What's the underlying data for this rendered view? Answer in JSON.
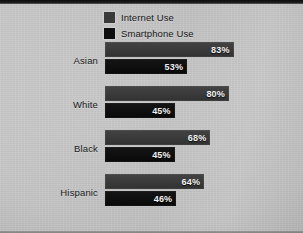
{
  "chart_data": {
    "type": "bar",
    "orientation": "horizontal",
    "title": "",
    "xlabel": "",
    "ylabel": "",
    "xlim": [
      0,
      100
    ],
    "grid": false,
    "legend_position": "top-left",
    "categories": [
      "Asian",
      "White",
      "Black",
      "Hispanic"
    ],
    "series": [
      {
        "name": "Internet Use",
        "color": "#3a3a3a",
        "values": [
          83,
          80,
          68,
          64
        ],
        "labels": [
          "83%",
          "80%",
          "68%",
          "64%"
        ]
      },
      {
        "name": "Smartphone Use",
        "color": "#0e0e0e",
        "values": [
          53,
          45,
          45,
          46
        ],
        "labels": [
          "53%",
          "45%",
          "45%",
          "46%"
        ]
      }
    ]
  },
  "legend": {
    "items": [
      {
        "label": "Internet Use",
        "swatch": "#3a3a3a"
      },
      {
        "label": "Smartphone Use",
        "swatch": "#0e0e0e"
      }
    ]
  },
  "groups": [
    {
      "category": "Asian",
      "internet": {
        "value": 83,
        "label": "83%"
      },
      "smartphone": {
        "value": 53,
        "label": "53%"
      }
    },
    {
      "category": "White",
      "internet": {
        "value": 80,
        "label": "80%"
      },
      "smartphone": {
        "value": 45,
        "label": "45%"
      }
    },
    {
      "category": "Black",
      "internet": {
        "value": 68,
        "label": "68%"
      },
      "smartphone": {
        "value": 45,
        "label": "45%"
      }
    },
    {
      "category": "Hispanic",
      "internet": {
        "value": 64,
        "label": "64%"
      },
      "smartphone": {
        "value": 46,
        "label": "46%"
      }
    }
  ],
  "scale": {
    "px_per_percent": 1.55,
    "bar_origin_px": 105
  },
  "colors": {
    "background": "#c4c4c4",
    "internet_bar": "#3a3a3a",
    "smartphone_bar": "#0e0e0e",
    "value_text": "#f2f2f2",
    "label_text": "#1a1a1a"
  }
}
